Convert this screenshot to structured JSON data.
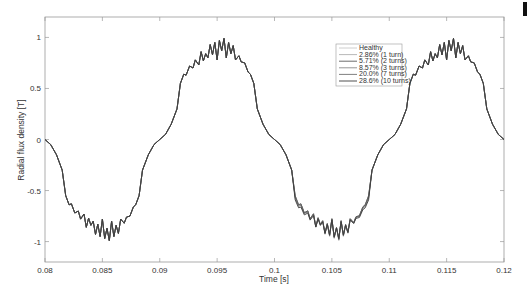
{
  "chart_data": {
    "type": "line",
    "title": "",
    "xlabel": "Time [s]",
    "ylabel": "Radial flux density [T]",
    "xlim": [
      0.08,
      0.12
    ],
    "ylim": [
      -1.2,
      1.2
    ],
    "xticks": [
      0.08,
      0.085,
      0.09,
      0.095,
      0.1,
      0.105,
      0.11,
      0.115,
      0.12
    ],
    "xtick_labels": [
      "0.08",
      "0.085",
      "0.09",
      "0.095",
      "0.1",
      "0.105",
      "0.11",
      "0.115",
      "0.12"
    ],
    "yticks": [
      -1,
      -0.5,
      0,
      0.5,
      1
    ],
    "ytick_labels": [
      "-1",
      "-0.5",
      "0",
      "0.5",
      "1"
    ],
    "grid": false,
    "legend_position": "upper right (inside, near x=0.1)",
    "half_cycle_shape": {
      "period_s": 0.02,
      "points_t_offset": [
        0.0,
        0.0005,
        0.001,
        0.0015,
        0.0018,
        0.0021,
        0.0023,
        0.0026,
        0.0029,
        0.0031,
        0.0034,
        0.0036,
        0.0038,
        0.004,
        0.0042,
        0.0044,
        0.0046,
        0.0048,
        0.005,
        0.0052,
        0.0054,
        0.0056,
        0.0058,
        0.006,
        0.0062,
        0.0064,
        0.0066,
        0.0069,
        0.0071,
        0.0074,
        0.0077,
        0.0079,
        0.0082,
        0.0085,
        0.009,
        0.0095,
        0.01
      ],
      "points_abs_B": [
        0.0,
        0.05,
        0.15,
        0.3,
        0.55,
        0.64,
        0.63,
        0.72,
        0.7,
        0.78,
        0.73,
        0.86,
        0.77,
        0.84,
        0.8,
        0.93,
        0.83,
        0.95,
        0.78,
        0.97,
        0.87,
        0.99,
        0.8,
        0.95,
        0.84,
        0.92,
        0.78,
        0.82,
        0.76,
        0.75,
        0.66,
        0.64,
        0.55,
        0.3,
        0.15,
        0.05,
        0.0
      ]
    },
    "series": [
      {
        "name": "Healthy",
        "color": "#c8c8c8",
        "fault_scale_negative_half_2": 1.0
      },
      {
        "name": "2.86% (1 turn)",
        "color": "#b0b0b0",
        "fault_scale_negative_half_2": 0.99
      },
      {
        "name": "5.71% (2 turns)",
        "color": "#5a5a5a",
        "fault_scale_negative_half_2": 0.97
      },
      {
        "name": "8.57% (3 turns)",
        "color": "#8a8a8a",
        "fault_scale_negative_half_2": 0.95
      },
      {
        "name": "20.0% (7 turns)",
        "color": "#707070",
        "fault_scale_negative_half_2": 0.9
      },
      {
        "name": "28.6% (10 turns)",
        "color": "#3c3c3c",
        "fault_scale_negative_half_2": 0.86
      }
    ]
  },
  "legend": {
    "items": [
      "Healthy",
      "2.86% (1 turn)",
      "5.71% (2 turns)",
      "8.57% (3 turns)",
      "20.0% (7 turns)",
      "28.6% (10 turns)"
    ]
  }
}
